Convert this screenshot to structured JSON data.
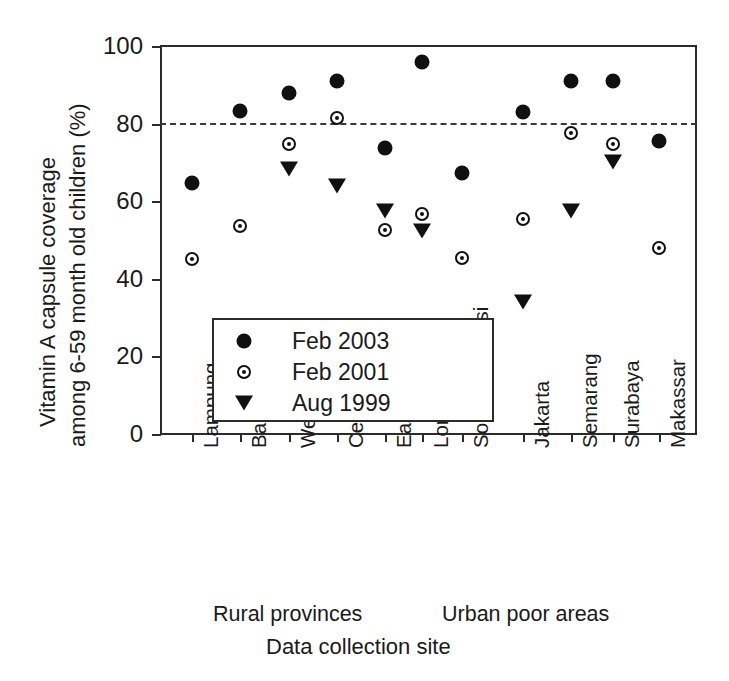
{
  "chart_data": {
    "type": "scatter",
    "title": "",
    "xlabel": "Data collection site",
    "ylabel": "Vitamin A capsule coverage among 6-59 month old children (%)",
    "ylabel_line1": "Vitamin A capsule coverage",
    "ylabel_line2": "among 6-59 month old children (%)",
    "ylim": [
      0,
      100
    ],
    "yticks": [
      0,
      20,
      40,
      60,
      80,
      100
    ],
    "ytick_labels": [
      "0",
      "20",
      "40",
      "60",
      "80",
      "100"
    ],
    "grid": false,
    "legend_position": "lower-left-inside",
    "annotations": [
      {
        "name": "target-threshold",
        "type": "hline",
        "y": 80,
        "style": "dashed"
      }
    ],
    "categories": [
      "Lampung",
      "Banten",
      "West Java",
      "Central Java",
      "East Java",
      "Lombok",
      "South Sulawesi",
      "Jakarta",
      "Semarang",
      "Surabaya",
      "Makassar"
    ],
    "groups": [
      {
        "label": "Rural provinces",
        "categories": [
          "Lampung",
          "Banten",
          "West Java",
          "Central Java",
          "East Java",
          "Lombok",
          "South Sulawesi"
        ]
      },
      {
        "label": "Urban poor areas",
        "categories": [
          "Jakarta",
          "Semarang",
          "Surabaya",
          "Makassar"
        ]
      }
    ],
    "series": [
      {
        "name": "Feb 2003",
        "marker": "filled-circle",
        "color": "#101010",
        "values": [
          64.8,
          83.3,
          88.0,
          91.0,
          73.6,
          96.0,
          67.3,
          82.9,
          91.0,
          91.0,
          75.6
        ]
      },
      {
        "name": "Feb 2001",
        "marker": "open-circle-dot",
        "color": "#101010",
        "values": [
          45.0,
          53.6,
          74.8,
          81.5,
          52.6,
          56.6,
          45.4,
          55.3,
          77.7,
          74.8,
          47.9
        ]
      },
      {
        "name": "Aug 1999",
        "marker": "triangle-down",
        "color": "#101010",
        "values": [
          null,
          null,
          68.3,
          63.8,
          57.5,
          52.4,
          null,
          34.0,
          57.6,
          70.2,
          null
        ]
      }
    ]
  },
  "legend": {
    "entries": [
      {
        "label": "Feb 2003",
        "marker": "filled-circle"
      },
      {
        "label": "Feb 2001",
        "marker": "open-circle-dot"
      },
      {
        "label": "Aug 1999",
        "marker": "triangle-down"
      }
    ]
  }
}
